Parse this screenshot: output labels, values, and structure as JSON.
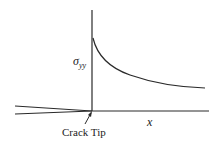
{
  "diagram": {
    "y_axis_label": {
      "symbol": "σ",
      "subscript": "yy"
    },
    "x_axis_label": "x",
    "annotation": "Crack Tip",
    "line_color": "#2a2a2a",
    "curve": {
      "type": "1/sqrt(x) decay",
      "start": [
        93,
        38
      ],
      "end": [
        205,
        88
      ]
    }
  }
}
